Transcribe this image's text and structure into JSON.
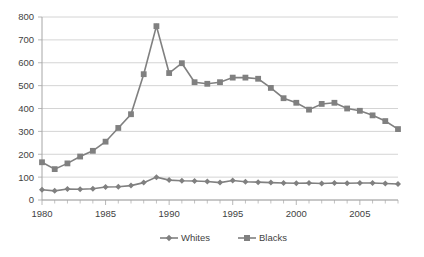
{
  "chart_data": {
    "type": "line",
    "title": "",
    "subtitle": "",
    "xlabel": "",
    "ylabel": "",
    "xlim": [
      1980,
      2008
    ],
    "ylim": [
      0,
      800
    ],
    "ytick_step": 100,
    "yticks": [
      0,
      100,
      200,
      300,
      400,
      500,
      600,
      700,
      800
    ],
    "ytick_labels": [
      "0",
      "100",
      "200",
      "300",
      "400",
      "500",
      "600",
      "700",
      "800"
    ],
    "xticks_major": [
      1980,
      1985,
      1990,
      1995,
      2000,
      2005
    ],
    "xtick_labels": [
      "1980",
      "1985",
      "1990",
      "1995",
      "2000",
      "2005"
    ],
    "xticks_minor_every": 1,
    "grid": "horizontal",
    "legend_position": "bottom-center",
    "x": [
      1980,
      1981,
      1982,
      1983,
      1984,
      1985,
      1986,
      1987,
      1988,
      1989,
      1990,
      1991,
      1992,
      1993,
      1994,
      1995,
      1996,
      1997,
      1998,
      1999,
      2000,
      2001,
      2002,
      2003,
      2004,
      2005,
      2006,
      2007,
      2008
    ],
    "series": [
      {
        "name": "Whites",
        "marker": "diamond",
        "color": "#808080",
        "values": [
          45,
          40,
          48,
          47,
          49,
          57,
          58,
          63,
          76,
          100,
          87,
          84,
          83,
          81,
          76,
          85,
          80,
          78,
          76,
          74,
          73,
          74,
          72,
          74,
          73,
          74,
          74,
          72,
          70
        ]
      },
      {
        "name": "Blacks",
        "marker": "square",
        "color": "#808080",
        "values": [
          165,
          135,
          160,
          190,
          215,
          255,
          315,
          375,
          550,
          760,
          555,
          598,
          515,
          508,
          515,
          535,
          535,
          530,
          490,
          445,
          425,
          395,
          420,
          425,
          400,
          390,
          370,
          345,
          310
        ]
      }
    ]
  },
  "legend": {
    "items": [
      {
        "label": "Whites",
        "marker": "diamond",
        "color": "#808080"
      },
      {
        "label": "Blacks",
        "marker": "square",
        "color": "#808080"
      }
    ]
  },
  "style": {
    "background": "#ffffff",
    "grid_color": "#c9c9c9",
    "axis_color": "#a6a6a6",
    "text_color": "#3f3f3f",
    "series_color": "#808080"
  }
}
